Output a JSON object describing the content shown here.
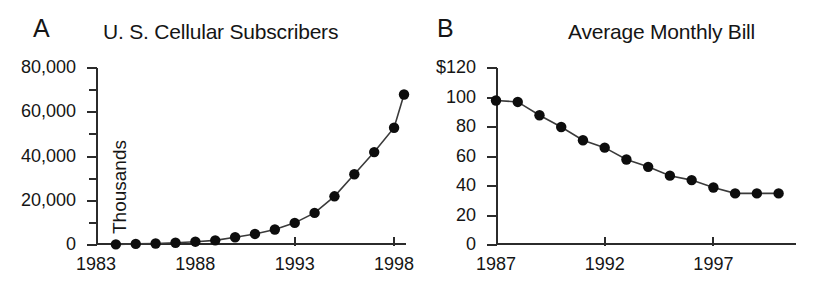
{
  "figure": {
    "background": "#ffffff",
    "ink_color": "#151515",
    "marker_color": "#0d0d0d",
    "line_color": "#3a3a3a"
  },
  "panels": [
    {
      "letter": "A",
      "title": "U. S. Cellular Subscribers",
      "ylabel": "Thousands",
      "y_ticks": [
        "0",
        "20,000",
        "40,000",
        "60,000",
        "80,000"
      ],
      "x_ticks": [
        "1983",
        "1988",
        "1993",
        "1998"
      ]
    },
    {
      "letter": "B",
      "title": "Average Monthly Bill",
      "ylabel": "",
      "y_ticks": [
        "0",
        "20",
        "40",
        "60",
        "80",
        "100",
        "$120"
      ],
      "x_ticks": [
        "1987",
        "1992",
        "1997"
      ]
    }
  ],
  "chart_data": [
    {
      "type": "line",
      "panel": "A",
      "title": "U. S. Cellular Subscribers",
      "xlabel": "",
      "ylabel": "Thousands",
      "xlim": [
        1983,
        1998.6
      ],
      "ylim": [
        0,
        80000
      ],
      "xticks": [
        1983,
        1988,
        1993,
        1998
      ],
      "xticklabels": [
        "1983",
        "1988",
        "1993",
        "1998"
      ],
      "yticks": [
        0,
        20000,
        40000,
        60000,
        80000
      ],
      "yticklabels": [
        "0",
        "20,000",
        "40,000",
        "60,000",
        "80,000"
      ],
      "y_minor_tick_interval": 10000,
      "grid": false,
      "legend": false,
      "markers": "filled-circle",
      "x": [
        1984,
        1985,
        1986,
        1987,
        1988,
        1989,
        1990,
        1991,
        1992,
        1993,
        1994,
        1995,
        1996,
        1997,
        1998,
        1998.5
      ],
      "values": [
        300,
        500,
        700,
        1000,
        1500,
        2100,
        3500,
        5000,
        7000,
        10000,
        14500,
        22000,
        32000,
        42000,
        53000,
        68000
      ],
      "series": [
        {
          "name": "U.S. cellular subscribers (thousands)",
          "values": [
            300,
            500,
            700,
            1000,
            1500,
            2100,
            3500,
            5000,
            7000,
            10000,
            14500,
            22000,
            32000,
            42000,
            53000,
            68000
          ]
        }
      ]
    },
    {
      "type": "line",
      "panel": "B",
      "title": "Average Monthly Bill",
      "xlabel": "",
      "ylabel": "",
      "xlim": [
        1987,
        2000.8
      ],
      "ylim": [
        0,
        120
      ],
      "xticks": [
        1987,
        1992,
        1997
      ],
      "xticklabels": [
        "1987",
        "1992",
        "1997"
      ],
      "yticks": [
        0,
        20,
        40,
        60,
        80,
        100,
        120
      ],
      "yticklabels": [
        "0",
        "20",
        "40",
        "60",
        "80",
        "100",
        "$120"
      ],
      "grid": false,
      "legend": false,
      "markers": "filled-circle",
      "x": [
        1987,
        1988,
        1989,
        1990,
        1991,
        1992,
        1993,
        1994,
        1995,
        1996,
        1997,
        1998,
        1999,
        2000
      ],
      "values": [
        98,
        97,
        88,
        80,
        71,
        66,
        58,
        53,
        47,
        44,
        39,
        35,
        35,
        35
      ],
      "series": [
        {
          "name": "Average monthly bill (dollars)",
          "values": [
            98,
            97,
            88,
            80,
            71,
            66,
            58,
            53,
            47,
            44,
            39,
            35
          ]
        }
      ]
    }
  ]
}
